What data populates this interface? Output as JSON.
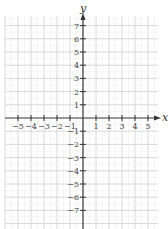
{
  "chart_data": {
    "type": "scatter",
    "title": "",
    "xlabel": "x",
    "ylabel": "y",
    "xlim": [
      -6,
      6
    ],
    "ylim": [
      -8,
      8
    ],
    "grid": true,
    "x_ticks": [
      -5,
      -4,
      -3,
      -2,
      -1,
      1,
      2,
      3,
      4,
      5
    ],
    "y_ticks": [
      7,
      6,
      5,
      4,
      3,
      2,
      1,
      -1,
      -2,
      -3,
      -4,
      -5,
      -6,
      -7
    ],
    "x_tick_labels": [
      "−5",
      "−4",
      "−3",
      "−2",
      "−1",
      "1",
      "2",
      "3",
      "4",
      "5"
    ],
    "y_tick_labels": [
      "7",
      "6",
      "5",
      "4",
      "3",
      "2",
      "1",
      "−1",
      "−2",
      "−3",
      "−4",
      "−5",
      "−6",
      "−7"
    ],
    "series": []
  },
  "style": {
    "grid_color": "#d8d8d8",
    "axis_color": "#333333",
    "background": "#ffffff"
  }
}
